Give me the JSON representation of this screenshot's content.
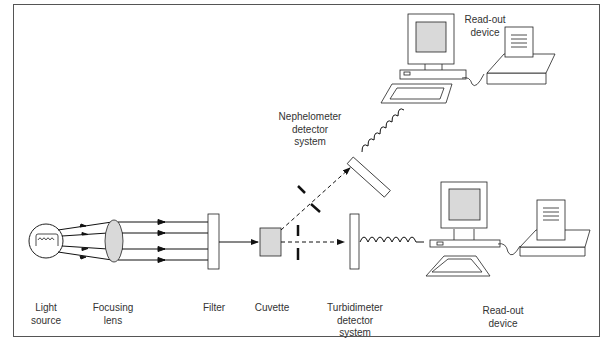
{
  "diagram": {
    "type": "optical-instrument-schematic",
    "components": [
      {
        "id": "light_source",
        "label": "Light\nsource"
      },
      {
        "id": "focusing_lens",
        "label": "Focusing\nlens"
      },
      {
        "id": "filter",
        "label": "Filter"
      },
      {
        "id": "cuvette",
        "label": "Cuvette"
      },
      {
        "id": "turbidimeter",
        "label": "Turbidimeter\ndetector\nsystem"
      },
      {
        "id": "readout_bottom",
        "label": "Read-out\ndevice"
      },
      {
        "id": "nephelometer",
        "label": "Nephelometer\ndetector\nsystem"
      },
      {
        "id": "readout_top",
        "label": "Read-out\ndevice"
      }
    ],
    "colors": {
      "line": "#111111",
      "fill_gray": "#d9d9d9",
      "frame": "#555555"
    }
  }
}
